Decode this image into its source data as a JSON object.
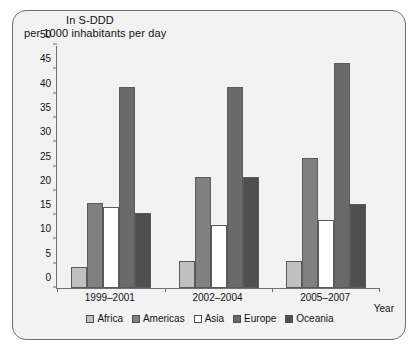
{
  "figure": {
    "title_line1": "In S-DDD",
    "title_line2": "per 1000 inhabitants per day"
  },
  "chart_data": {
    "type": "bar",
    "title": "In S-DDD per 1000 inhabitants per day",
    "xlabel": "Year",
    "ylabel": "In S-DDD per 1000 inhabitants per day",
    "ylim": [
      0,
      50
    ],
    "yticks": [
      0,
      5,
      10,
      15,
      20,
      25,
      30,
      35,
      40,
      45,
      50
    ],
    "ytick_labels": [
      "0",
      "5",
      "10",
      "15",
      "20",
      "25",
      "30",
      "35",
      "40",
      "45",
      "50"
    ],
    "grid": false,
    "legend_position": "bottom",
    "categories": [
      "1999–2001",
      "2002–2004",
      "2005–2007"
    ],
    "series": [
      {
        "name": "Africa",
        "color": "#c0c0c0",
        "values": [
          4.3,
          5.6,
          5.6
        ]
      },
      {
        "name": "Americas",
        "color": "#808080",
        "values": [
          17.4,
          22.8,
          26.7
        ]
      },
      {
        "name": "Asia",
        "color": "#ffffff",
        "values": [
          16.6,
          13.0,
          14.0
        ]
      },
      {
        "name": "Europe",
        "color": "#6a6a6a",
        "values": [
          41.4,
          41.4,
          46.4
        ]
      },
      {
        "name": "Oceania",
        "color": "#4f4f4f",
        "values": [
          15.4,
          22.8,
          17.2
        ]
      }
    ]
  }
}
